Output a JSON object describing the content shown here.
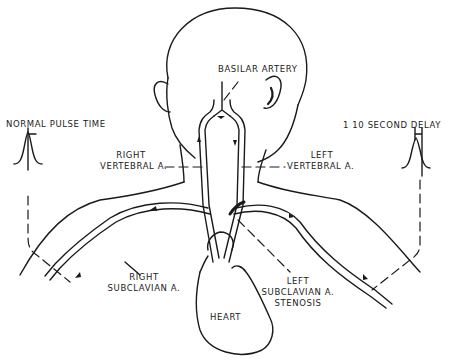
{
  "diagram": {
    "labels": {
      "basilar_artery": "BASILAR ARTERY",
      "normal_pulse_time": "NORMAL PULSE TIME",
      "second_delay": "1 10 SECOND DELAY",
      "right_vertebral_line1": "RIGHT",
      "right_vertebral_line2": "VERTEBRAL A.",
      "left_vertebral_line1": "LEFT",
      "left_vertebral_line2": "VERTEBRAL A.",
      "right_subclavian_line1": "RIGHT",
      "right_subclavian_line2": "SUBCLAVIAN A.",
      "left_subclavian_line1": "LEFT",
      "left_subclavian_line2": "SUBCLAVIAN A.",
      "left_subclavian_line3": "STENOSIS",
      "heart": "HEART"
    },
    "colors": {
      "line": "#1a1a1a",
      "background": "#ffffff"
    }
  }
}
